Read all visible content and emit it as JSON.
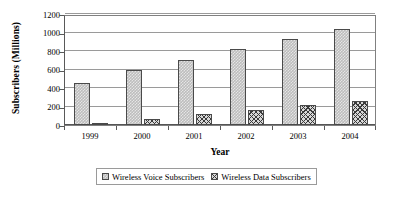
{
  "chart_data": {
    "type": "bar",
    "title": "",
    "subtitle": "",
    "xlabel": "Year",
    "ylabel": "Subscribers (Millions)",
    "categories": [
      "1999",
      "2000",
      "2001",
      "2002",
      "2003",
      "2004"
    ],
    "series": [
      {
        "name": "Wireless Voice Subscribers",
        "values": [
          455,
          595,
          700,
          820,
          935,
          1040
        ],
        "pattern": "light-stipple",
        "color": "#bdbdbd"
      },
      {
        "name": "Wireless Data Subscribers",
        "values": [
          20,
          60,
          115,
          160,
          215,
          265
        ],
        "pattern": "dark-crosshatch",
        "color": "#3a3a3a"
      }
    ],
    "ylim": [
      0,
      1200
    ],
    "y_ticks": [
      0,
      200,
      400,
      600,
      800,
      1000,
      1200
    ],
    "y_tick_labels": [
      "0",
      "200",
      "400",
      "600",
      "800",
      "1000",
      "1200"
    ],
    "grid": true,
    "grid_axis": "y",
    "legend_position": "bottom",
    "legend_entries": [
      "Wireless Voice Subscribers",
      "Wireless Data Subscribers"
    ],
    "annotations": []
  },
  "axes": {
    "y_title": "Subscribers (Millions)",
    "x_title": "Year"
  },
  "colors": {
    "plot_border": "#808080",
    "gridline": "#9a9a9a",
    "axis": "#595959",
    "bar_outline": "#4a4a4a",
    "voice_fill": "#bdbdbd",
    "data_fill": "#3a3a3a",
    "background": "#ffffff"
  }
}
